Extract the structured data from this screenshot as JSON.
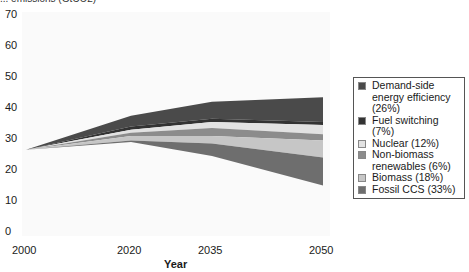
{
  "chart_data": {
    "type": "area",
    "title": "",
    "top_label_partial": "... emissions (GtCO2)",
    "xlabel": "Year",
    "ylabel": "",
    "x": [
      2000,
      2020,
      2035,
      2050
    ],
    "xticks": [
      "2000",
      "2020",
      "2035",
      "2050"
    ],
    "yticks": [
      "0",
      "10",
      "20",
      "30",
      "40",
      "50",
      "60",
      "70"
    ],
    "ylim": [
      0,
      70
    ],
    "grid": false,
    "legend_position": "right",
    "baseline_emissions": [
      26.5,
      37.5,
      42,
      43.5
    ],
    "series": [
      {
        "name": "Demand-side energy efficiency (26%)",
        "color": "#4a4a4a",
        "upper": [
          26.5,
          37.5,
          42,
          43.5
        ],
        "lower": [
          26.5,
          34,
          36.5,
          35.5
        ]
      },
      {
        "name": "Fuel switching (7%)",
        "color": "#333333",
        "upper": [
          26.5,
          34,
          36.5,
          35.5
        ],
        "lower": [
          26.5,
          33,
          35.5,
          34.5
        ]
      },
      {
        "name": "Nuclear (12%)",
        "color": "#e2e2e2",
        "upper": [
          26.5,
          33,
          35.5,
          34.5
        ],
        "lower": [
          26.5,
          32,
          33.5,
          31.5
        ]
      },
      {
        "name": "Non-biomass renewables (6%)",
        "color": "#8c8c8c",
        "upper": [
          26.5,
          32,
          33.5,
          31.5
        ],
        "lower": [
          26.5,
          31,
          31,
          29.5
        ]
      },
      {
        "name": "Biomass (18%)",
        "color": "#c6c6c6",
        "upper": [
          26.5,
          31,
          31,
          29.5
        ],
        "lower": [
          26.5,
          29.5,
          28.5,
          24
        ]
      },
      {
        "name": "Fossil CCS (33%)",
        "color": "#6e6e6e",
        "upper": [
          26.5,
          29.5,
          28.5,
          24
        ],
        "lower": [
          26.5,
          29,
          24.5,
          15
        ]
      }
    ]
  },
  "legend": {
    "items": [
      {
        "label": "Demand-side energy efficiency (26%)",
        "color": "#4a4a4a"
      },
      {
        "label": "Fuel switching (7%)",
        "color": "#333333"
      },
      {
        "label": "Nuclear (12%)",
        "color": "#e2e2e2"
      },
      {
        "label": "Non-biomass renewables (6%)",
        "color": "#8c8c8c"
      },
      {
        "label": "Biomass (18%)",
        "color": "#c6c6c6"
      },
      {
        "label": "Fossil CCS (33%)",
        "color": "#6e6e6e"
      }
    ]
  }
}
